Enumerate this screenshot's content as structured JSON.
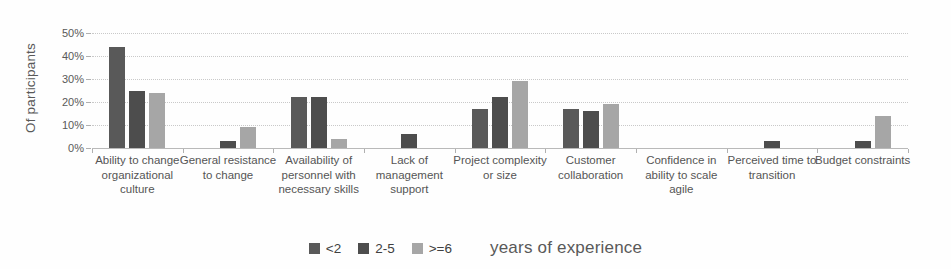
{
  "chart_data": {
    "type": "bar",
    "title": "",
    "xlabel": "",
    "ylabel": "Of participants",
    "ylim": [
      0,
      50
    ],
    "y_ticks": [
      "0%",
      "10%",
      "20%",
      "30%",
      "40%",
      "50%"
    ],
    "grid": "horizontal-dotted",
    "legend_position": "bottom-center",
    "legend_suffix": "years of experience",
    "categories": [
      "Ability to change organizational culture",
      "General resistance to change",
      "Availability of personnel with necessary skills",
      "Lack of management support",
      "Project complexity or size",
      "Customer collaboration",
      "Confidence in ability to scale agile",
      "Perceived time to transition",
      "Budget constraints"
    ],
    "series": [
      {
        "name": "<2",
        "color": "#595959",
        "values": [
          44,
          0,
          22,
          0,
          17,
          17,
          0,
          0,
          0
        ]
      },
      {
        "name": "2-5",
        "color": "#4d4d4d",
        "values": [
          25,
          3,
          22,
          6,
          22,
          16,
          0,
          3,
          3
        ]
      },
      {
        "name": ">=6",
        "color": "#a6a6a6",
        "values": [
          24,
          9,
          4,
          0,
          29,
          19,
          0,
          0,
          14
        ]
      }
    ]
  },
  "colors": {
    "axis": "#b9b9b9",
    "gridline": "#c9c9c9",
    "text": "#595959",
    "background": "#fefefe"
  }
}
